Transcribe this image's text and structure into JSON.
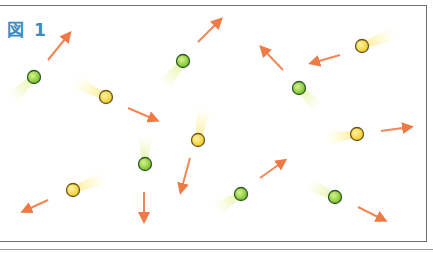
{
  "figure": {
    "label": "図 1"
  },
  "colors": {
    "green_particle": "#8fd23a",
    "yellow_particle": "#f5d63a",
    "arrow": "#f07a45",
    "frame": "#6e6e6e",
    "label": "#3b8cc2"
  },
  "particles": [
    {
      "type": "green",
      "x": 34,
      "y": 77,
      "trail_dx": -14,
      "trail_dy": 14
    },
    {
      "type": "green",
      "x": 183,
      "y": 61,
      "trail_dx": -12,
      "trail_dy": 16
    },
    {
      "type": "green",
      "x": 299,
      "y": 88,
      "trail_dx": 12,
      "trail_dy": 12
    },
    {
      "type": "green",
      "x": 145,
      "y": 164,
      "trail_dx": 0,
      "trail_dy": -18
    },
    {
      "type": "green",
      "x": 241,
      "y": 194,
      "trail_dx": -16,
      "trail_dy": 10
    },
    {
      "type": "green",
      "x": 335,
      "y": 197,
      "trail_dx": -16,
      "trail_dy": -8
    },
    {
      "type": "yellow",
      "x": 106,
      "y": 97,
      "trail_dx": -20,
      "trail_dy": -10
    },
    {
      "type": "yellow",
      "x": 362,
      "y": 46,
      "trail_dx": 20,
      "trail_dy": -8
    },
    {
      "type": "yellow",
      "x": 198,
      "y": 140,
      "trail_dx": 4,
      "trail_dy": -20
    },
    {
      "type": "yellow",
      "x": 357,
      "y": 134,
      "trail_dx": -20,
      "trail_dy": 3
    },
    {
      "type": "yellow",
      "x": 73,
      "y": 190,
      "trail_dx": 20,
      "trail_dy": -8
    }
  ],
  "arrows": [
    {
      "x1": 48,
      "y1": 60,
      "x2": 69,
      "y2": 34
    },
    {
      "x1": 198,
      "y1": 42,
      "x2": 220,
      "y2": 20
    },
    {
      "x1": 283,
      "y1": 70,
      "x2": 262,
      "y2": 48
    },
    {
      "x1": 340,
      "y1": 55,
      "x2": 312,
      "y2": 63
    },
    {
      "x1": 128,
      "y1": 108,
      "x2": 156,
      "y2": 120
    },
    {
      "x1": 190,
      "y1": 158,
      "x2": 181,
      "y2": 191
    },
    {
      "x1": 144,
      "y1": 192,
      "x2": 144,
      "y2": 220
    },
    {
      "x1": 48,
      "y1": 200,
      "x2": 24,
      "y2": 211
    },
    {
      "x1": 260,
      "y1": 178,
      "x2": 284,
      "y2": 161
    },
    {
      "x1": 381,
      "y1": 131,
      "x2": 410,
      "y2": 127
    },
    {
      "x1": 358,
      "y1": 207,
      "x2": 384,
      "y2": 220
    }
  ]
}
